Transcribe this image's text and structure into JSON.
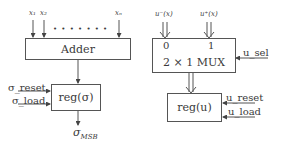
{
  "left": {
    "inputs": [
      "x₁",
      "x₂",
      "xₙ"
    ],
    "ellipsis": "• • • • • • •",
    "adder_label": "Adder",
    "reg_label": "reg(σ)",
    "reset_label": "σ_reset",
    "load_label": "σ_load",
    "output_label": "σ",
    "output_sub": "MSB"
  },
  "right": {
    "inputs": [
      "u⁻(x)",
      "u⁺(x)"
    ],
    "mux_port0": "0",
    "mux_port1": "1",
    "mux_label": "2 × 1 MUX",
    "sel_label": "u_sel",
    "reg_label": "reg(u)",
    "reset_label": "u_reset",
    "load_label": "u_load"
  }
}
